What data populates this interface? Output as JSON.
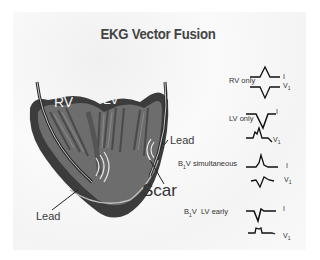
{
  "title": "EKG Vector Fusion",
  "heart": {
    "labels": {
      "rv": "RV",
      "lv": "LV",
      "lead_right": "Lead",
      "lead_left": "Lead",
      "scar": "Scar"
    }
  },
  "rows": [
    {
      "label": "RV only",
      "leads": [
        {
          "name": "I"
        },
        {
          "name": "V",
          "sub": "1"
        }
      ]
    },
    {
      "label": "LV only",
      "leads": [
        {
          "name": "I"
        },
        {
          "name": "V",
          "sub": "1"
        }
      ]
    },
    {
      "label_prefix": "B",
      "label_sub": "1",
      "label": "V simultaneous",
      "leads": [
        {
          "name": "I"
        },
        {
          "name": "V",
          "sub": "1"
        }
      ]
    },
    {
      "label_prefix": "B",
      "label_sub": "1",
      "label": "V  LV early",
      "leads": [
        {
          "name": "I"
        },
        {
          "name": "V",
          "sub": "1"
        }
      ]
    }
  ],
  "colors": {
    "background": "#ffffff",
    "slide": "#f6f6f6",
    "text": "#333333",
    "heart_dark": "#3a3a3a",
    "heart_mid": "#6e6e6e"
  }
}
